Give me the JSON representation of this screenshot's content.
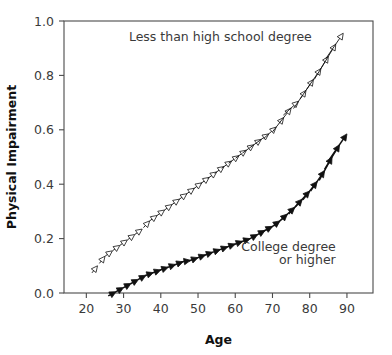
{
  "chart_data": {
    "type": "line",
    "title": "",
    "xlabel": "Age",
    "ylabel": "Physical Impairment",
    "xlim": [
      14,
      97
    ],
    "ylim": [
      0.0,
      1.0
    ],
    "grid": false,
    "legend_position": "inline-annotations",
    "xticks": [
      20,
      30,
      40,
      50,
      60,
      70,
      80,
      90
    ],
    "xtick_labels": [
      "20",
      "30",
      "40",
      "50",
      "60",
      "70",
      "80",
      "90"
    ],
    "yticks": [
      0.0,
      0.2,
      0.4,
      0.6,
      0.8,
      1.0
    ],
    "ytick_labels": [
      "0.0",
      "0.2",
      "0.4",
      "0.6",
      "0.8",
      "1.0"
    ],
    "annotations": [
      {
        "text": "Less than high school degree",
        "x": 56,
        "y": 0.925,
        "align": "middle"
      },
      {
        "text": "College degree",
        "x": 87,
        "y": 0.155,
        "align": "end"
      },
      {
        "text": "or higher",
        "x": 87,
        "y": 0.105,
        "align": "end"
      }
    ],
    "series": [
      {
        "name": "Less than high school degree",
        "marker": "open-arrowhead",
        "color": "#111111",
        "fill": "#ffffff",
        "x": [
          23,
          25,
          27,
          29,
          31,
          33,
          35,
          37,
          39,
          41,
          43,
          45,
          47,
          49,
          51,
          53,
          55,
          57,
          59,
          61,
          63,
          65,
          67,
          69,
          71,
          73,
          75,
          77,
          79,
          81,
          83,
          85,
          87,
          89
        ],
        "y": [
          0.1,
          0.135,
          0.155,
          0.175,
          0.195,
          0.215,
          0.235,
          0.265,
          0.285,
          0.305,
          0.325,
          0.345,
          0.365,
          0.385,
          0.405,
          0.425,
          0.445,
          0.465,
          0.485,
          0.505,
          0.525,
          0.545,
          0.565,
          0.585,
          0.61,
          0.645,
          0.68,
          0.705,
          0.745,
          0.785,
          0.825,
          0.87,
          0.915,
          0.955
        ]
      },
      {
        "name": "College degree or higher",
        "marker": "filled-arrowhead",
        "color": "#111111",
        "fill": "#111111",
        "x": [
          28,
          30,
          32,
          34,
          36,
          38,
          40,
          42,
          44,
          46,
          48,
          50,
          52,
          54,
          56,
          58,
          60,
          62,
          64,
          66,
          68,
          70,
          72,
          74,
          76,
          78,
          80,
          82,
          84,
          86,
          88,
          90
        ],
        "y": [
          0.005,
          0.02,
          0.035,
          0.05,
          0.065,
          0.075,
          0.085,
          0.095,
          0.105,
          0.115,
          0.12,
          0.13,
          0.14,
          0.15,
          0.16,
          0.17,
          0.18,
          0.19,
          0.2,
          0.215,
          0.23,
          0.245,
          0.265,
          0.29,
          0.315,
          0.345,
          0.375,
          0.41,
          0.45,
          0.5,
          0.545,
          0.585
        ]
      }
    ]
  }
}
